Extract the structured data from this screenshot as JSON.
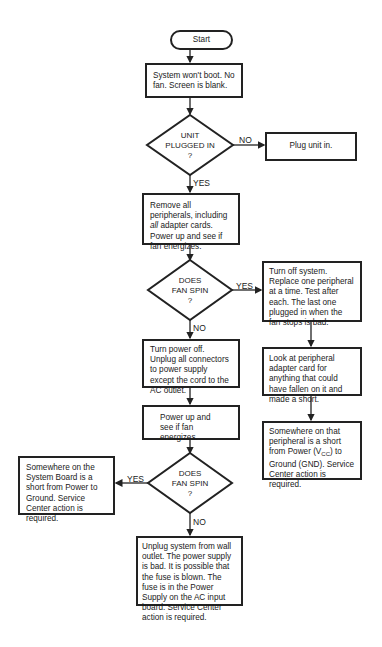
{
  "flowchart": {
    "start": "Start",
    "problem": "System won't boot. No fan. Screen is blank.",
    "decision_plugged": {
      "lines": [
        "UNIT",
        "PLUGGED IN",
        "?"
      ]
    },
    "plug_in": "Plug unit in.",
    "remove_peripherals": {
      "part1": "Remove all peripherals, including ",
      "emphasis": "all",
      "part2": " adapter cards. Power up and see if fan energizes."
    },
    "decision_fan1": {
      "lines": [
        "DOES",
        "FAN SPIN",
        "?"
      ]
    },
    "replace_peripheral": "Turn off system. Replace one peripheral at a time. Test after each. The last one plugged in when the fan stops is bad.",
    "look_adapter": "Look at peripheral adapter card for anything that could have fallen on it and made a short.",
    "peripheral_short": {
      "part1": "Somewhere on that peripheral is a short from Power (V",
      "subscript": "CC",
      "part2": ") to Ground (GND). Service Center action is required."
    },
    "turn_power_off": "Turn power off. Unplug all connectors to power supply except the cord to the AC outlet.",
    "power_up_see": "Power up and see if fan energizes.",
    "decision_fan2": {
      "lines": [
        "DOES",
        "FAN SPIN",
        "?"
      ]
    },
    "system_board_short": "Somewhere on the System Board is a short from Power to Ground. Service Center action is required.",
    "power_supply_bad": "Unplug system from wall outlet. The power supply is bad. It is possible that the fuse is blown. The fuse is in the Power Supply on the AC input board. Service Center action is required.",
    "labels": {
      "yes": "YES",
      "no": "NO"
    }
  }
}
